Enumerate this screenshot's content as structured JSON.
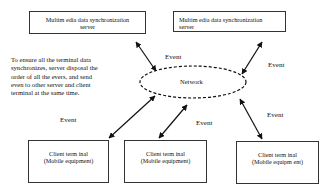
{
  "servers": [
    {
      "line1": "Multim edia data synchronization",
      "line2": "server"
    },
    {
      "line1": "Multim edia data synchronization",
      "line2": "server"
    }
  ],
  "network": {
    "label": "Network"
  },
  "clients": [
    {
      "line1": "Client term inal",
      "line2": "(Mobile equipment)"
    },
    {
      "line1": "Client term inal",
      "line2": "(Mobile equipment)"
    },
    {
      "line1": "Client term inal",
      "line2": "(Mobile equipm ent)"
    }
  ],
  "event_labels": [
    "Event",
    "Event",
    "Event",
    "Event",
    "Event"
  ],
  "note": {
    "lines": [
      "To ensure all the terminal data",
      "synchronizes, server disposal the",
      "order of all the evers, and send",
      "even to other server and client",
      "terminal at the same time."
    ]
  },
  "colors": {
    "stroke": "#111111",
    "background": "#ffffff"
  }
}
